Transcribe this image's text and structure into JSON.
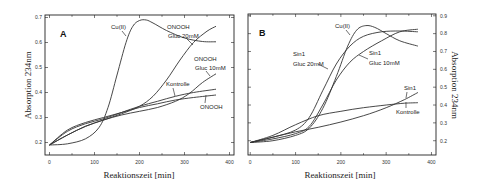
{
  "chart_data": [
    {
      "type": "line",
      "panel": "A",
      "xlabel": "Reaktionszeit [min]",
      "ylabel": "Absorption 234nm",
      "ylabel_side": "left",
      "xlim": [
        -10,
        410
      ],
      "ylim": [
        0.15,
        0.71
      ],
      "xticks": [
        0,
        100,
        200,
        300,
        400
      ],
      "yticks": [
        0.2,
        0.3,
        0.4,
        0.5,
        0.6,
        0.7
      ],
      "grid": false,
      "frame": {
        "x0": 45,
        "x1": 234,
        "y0": 15,
        "y1": 155
      },
      "series": [
        {
          "name": "Cu(II)",
          "x": [
            0,
            40,
            80,
            110,
            130,
            150,
            170,
            185,
            200,
            215,
            230,
            260,
            300,
            340,
            370
          ],
          "y": [
            0.19,
            0.195,
            0.215,
            0.26,
            0.34,
            0.47,
            0.6,
            0.665,
            0.688,
            0.69,
            0.678,
            0.648,
            0.618,
            0.604,
            0.603
          ]
        },
        {
          "name": "ONOOH Gluc 20mM",
          "x": [
            0,
            40,
            80,
            120,
            160,
            200,
            230,
            260,
            290,
            320,
            350,
            370
          ],
          "y": [
            0.19,
            0.23,
            0.265,
            0.29,
            0.315,
            0.345,
            0.385,
            0.45,
            0.53,
            0.6,
            0.645,
            0.665
          ]
        },
        {
          "name": "ONOOH Gluc 10mM",
          "x": [
            0,
            40,
            80,
            120,
            160,
            200,
            240,
            280,
            310,
            340,
            370
          ],
          "y": [
            0.19,
            0.23,
            0.265,
            0.29,
            0.31,
            0.325,
            0.34,
            0.365,
            0.395,
            0.44,
            0.475
          ]
        },
        {
          "name": "Kontrolle",
          "x": [
            0,
            40,
            80,
            120,
            160,
            200,
            240,
            280,
            320,
            370
          ],
          "y": [
            0.19,
            0.245,
            0.275,
            0.295,
            0.32,
            0.345,
            0.365,
            0.385,
            0.4,
            0.413
          ]
        },
        {
          "name": "ONOOH",
          "x": [
            0,
            40,
            80,
            120,
            160,
            200,
            240,
            280,
            320,
            370
          ],
          "y": [
            0.19,
            0.25,
            0.28,
            0.3,
            0.32,
            0.34,
            0.355,
            0.37,
            0.38,
            0.39
          ]
        }
      ],
      "annotations": [
        {
          "text": "A",
          "role": "panel-label"
        },
        {
          "text": "Cu(II)"
        },
        {
          "text": "ONOOH"
        },
        {
          "text": "Gluc 20mM"
        },
        {
          "text": "ONOOH"
        },
        {
          "text": "Gluc 10mM"
        },
        {
          "text": "Kontrolle"
        },
        {
          "text": "ONOOH"
        }
      ]
    },
    {
      "type": "line",
      "panel": "B",
      "xlabel": "Reaktionszeit [min]",
      "ylabel": "Absorption 234nm",
      "ylabel_side": "right",
      "xlim": [
        -5,
        410
      ],
      "ylim": [
        0.12,
        0.91
      ],
      "xticks": [
        0,
        100,
        200,
        300,
        400
      ],
      "yticks": [
        0.2,
        0.3,
        0.4,
        0.5,
        0.6,
        0.7,
        0.8,
        0.9
      ],
      "grid": false,
      "frame": {
        "x0": 248,
        "x1": 436,
        "y0": 14,
        "y1": 155
      },
      "series": [
        {
          "name": "Cu(II)",
          "x": [
            0,
            50,
            100,
            130,
            160,
            190,
            215,
            235,
            255,
            275,
            300,
            330,
            370
          ],
          "y": [
            0.19,
            0.2,
            0.23,
            0.27,
            0.38,
            0.56,
            0.73,
            0.82,
            0.845,
            0.835,
            0.8,
            0.76,
            0.73
          ]
        },
        {
          "name": "Sin1 Gluc 20mM",
          "x": [
            0,
            50,
            100,
            130,
            160,
            190,
            220,
            250,
            290,
            330,
            370
          ],
          "y": [
            0.19,
            0.22,
            0.26,
            0.33,
            0.48,
            0.63,
            0.73,
            0.785,
            0.81,
            0.815,
            0.81
          ]
        },
        {
          "name": "Sin1 Gluc 10mM",
          "x": [
            0,
            50,
            100,
            130,
            160,
            190,
            220,
            250,
            290,
            330,
            370
          ],
          "y": [
            0.19,
            0.21,
            0.24,
            0.28,
            0.4,
            0.54,
            0.64,
            0.7,
            0.76,
            0.81,
            0.825
          ]
        },
        {
          "name": "Kontrolle",
          "x": [
            0,
            50,
            100,
            150,
            200,
            250,
            300,
            340,
            370
          ],
          "y": [
            0.19,
            0.23,
            0.29,
            0.34,
            0.365,
            0.385,
            0.4,
            0.41,
            0.413
          ]
        },
        {
          "name": "Sin1",
          "x": [
            0,
            50,
            100,
            150,
            200,
            250,
            300,
            340,
            370
          ],
          "y": [
            0.19,
            0.22,
            0.25,
            0.275,
            0.305,
            0.34,
            0.385,
            0.43,
            0.47
          ]
        }
      ],
      "annotations": [
        {
          "text": "B",
          "role": "panel-label"
        },
        {
          "text": "Cu(II)"
        },
        {
          "text": "Sin1"
        },
        {
          "text": "Gluc 20mM"
        },
        {
          "text": "Sin1"
        },
        {
          "text": "Gluc 10mM"
        },
        {
          "text": "Sin1"
        },
        {
          "text": "Kontrolle"
        }
      ]
    }
  ]
}
